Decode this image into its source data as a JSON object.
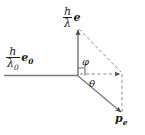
{
  "figure": {
    "type": "vector-diagram",
    "background_color": "#ffffff",
    "line_color": "#6b6b6b",
    "text_color": "#1a1a1a",
    "width": 145,
    "height": 135
  },
  "labels": {
    "incident_photon": {
      "numerator": "h",
      "denominator": "λ",
      "denominator_sub": "0",
      "vector": "e",
      "vector_sub": "0"
    },
    "scattered_photon": {
      "numerator": "h",
      "denominator": "λ",
      "vector": "e"
    },
    "electron_momentum": {
      "symbol": "p",
      "subscript": "e"
    },
    "angle_phi": "φ",
    "angle_theta": "θ"
  },
  "geometry": {
    "origin": {
      "x": 78,
      "y": 76
    },
    "incident_start": {
      "x": 4,
      "y": 75
    },
    "scattered_tip": {
      "x": 78,
      "y": 28
    },
    "electron_tip": {
      "x": 122,
      "y": 113
    },
    "corner": {
      "x": 122,
      "y": 73
    },
    "right_angle_marker": {
      "x": 78,
      "y": 76,
      "size": 8
    }
  }
}
